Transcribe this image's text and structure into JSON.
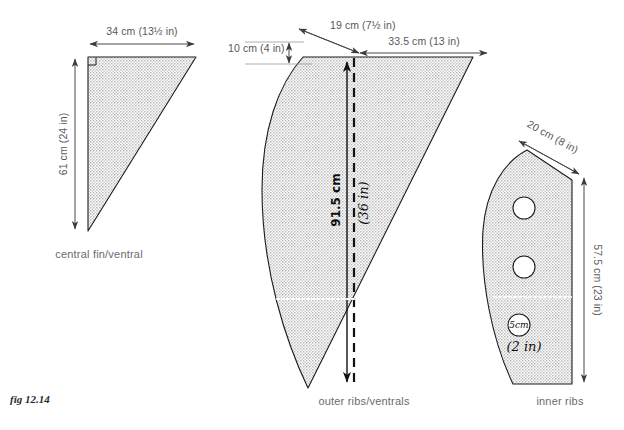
{
  "figure": {
    "caption": "fig 12.14"
  },
  "parts": {
    "central_fin": {
      "label": "central fin/ventral",
      "dimensions": {
        "top_width": "34 cm  (13½ in)",
        "left_height": "61 cm  (24 in)"
      }
    },
    "outer_ribs": {
      "label": "outer ribs/ventrals",
      "dimensions": {
        "nose_height": "10 cm  (4 in)",
        "top_bevel": "19 cm  (7½ in)",
        "top_width": "33.5 cm  (13 in)",
        "center_height_cm": "91.5 cm",
        "center_height_in": "(36 in)"
      }
    },
    "inner_ribs": {
      "label": "inner ribs",
      "dimensions": {
        "top_bevel": "20 cm  (8 in)",
        "right_height": "57.5 cm  (23 in)",
        "hole_diameter_cm": "5cm",
        "hole_diameter_in": "(2 in)"
      }
    }
  },
  "colors": {
    "ink": "#1c1c1c",
    "dimension_text": "#58595b",
    "part_label": "#6a6b6d",
    "fill_stipple": "#d8d8d8",
    "paper": "#ffffff",
    "handwriting": "#111111"
  }
}
